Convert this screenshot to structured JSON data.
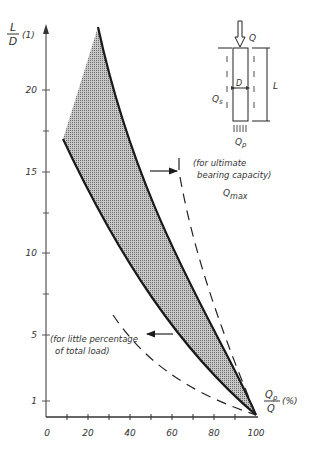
{
  "y_axis": {
    "label_num": "L",
    "label_den": "D",
    "unit": "(1)",
    "ticks": [
      {
        "label": "20",
        "value": 20
      },
      {
        "label": "15",
        "value": 15
      },
      {
        "label": "10",
        "value": 10
      },
      {
        "label": "5",
        "value": 5
      },
      {
        "label": "1",
        "value": 1
      }
    ]
  },
  "x_axis": {
    "label_num": "Q",
    "label_num_sub": "p",
    "label_den": "Q",
    "unit": "(%)",
    "ticks": [
      {
        "label": "0",
        "value": 0
      },
      {
        "label": "20",
        "value": 20
      },
      {
        "label": "40",
        "value": 40
      },
      {
        "label": "60",
        "value": 60
      },
      {
        "label": "80",
        "value": 80
      },
      {
        "label": "100",
        "value": 100
      }
    ]
  },
  "annotations": {
    "ultimate_line1": "(for ultimate",
    "ultimate_line2": "bearing capacity)",
    "qmax_main": "Q",
    "qmax_sub": "max",
    "little_line1": "(for little percentage",
    "little_line2": "of total load)"
  },
  "pile_diagram": {
    "load": "Q",
    "shaft_label": "Q",
    "shaft_sub": "s",
    "tip_label": "Q",
    "tip_sub": "p",
    "diameter": "D",
    "length": "L"
  },
  "colors": {
    "ink": "#1a1a1a",
    "shade": "#9a9a9a",
    "axis": "#555555"
  }
}
